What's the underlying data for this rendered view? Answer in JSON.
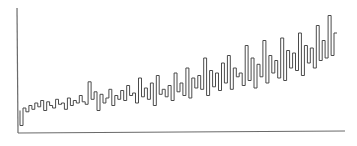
{
  "chart_data": {
    "type": "line",
    "title": "",
    "xlabel": "",
    "ylabel": "",
    "grid": false,
    "legend": null,
    "xlim": [
      0,
      107
    ],
    "ylim": [
      0,
      100
    ],
    "x": [
      0,
      1,
      2,
      3,
      4,
      5,
      6,
      7,
      8,
      9,
      10,
      11,
      12,
      13,
      14,
      15,
      16,
      17,
      18,
      19,
      20,
      21,
      22,
      23,
      24,
      25,
      26,
      27,
      28,
      29,
      30,
      31,
      32,
      33,
      34,
      35,
      36,
      37,
      38,
      39,
      40,
      41,
      42,
      43,
      44,
      45,
      46,
      47,
      48,
      49,
      50,
      51,
      52,
      53,
      54,
      55,
      56,
      57,
      58,
      59,
      60,
      61,
      62,
      63,
      64,
      65,
      66,
      67,
      68,
      69,
      70,
      71,
      72,
      73,
      74,
      75,
      76,
      77,
      78,
      79,
      80,
      81,
      82,
      83,
      84,
      85,
      86,
      87,
      88,
      89,
      90,
      91,
      92,
      93,
      94,
      95,
      96,
      97,
      98,
      99,
      100,
      101,
      102,
      103,
      104,
      105,
      106,
      107
    ],
    "series": [
      {
        "name": "series",
        "color": "#4a4a4a",
        "values": [
          18,
          6,
          20,
          17,
          22,
          19,
          24,
          21,
          26,
          18,
          25,
          22,
          20,
          27,
          23,
          24,
          19,
          28,
          22,
          26,
          24,
          30,
          25,
          23,
          41,
          27,
          33,
          18,
          31,
          24,
          28,
          35,
          22,
          30,
          27,
          34,
          26,
          38,
          30,
          32,
          24,
          44,
          29,
          36,
          27,
          40,
          22,
          46,
          31,
          35,
          29,
          38,
          26,
          48,
          33,
          40,
          30,
          52,
          28,
          44,
          36,
          46,
          35,
          60,
          30,
          50,
          37,
          48,
          34,
          56,
          40,
          62,
          35,
          52,
          45,
          48,
          38,
          70,
          42,
          60,
          36,
          55,
          45,
          74,
          40,
          62,
          48,
          58,
          44,
          76,
          42,
          66,
          52,
          64,
          50,
          80,
          46,
          70,
          56,
          68,
          52,
          86,
          58,
          74,
          60,
          94,
          62,
          80
        ]
      }
    ],
    "axes": {
      "x_axis_visible": true,
      "y_axis_visible": true,
      "tick_labels": false
    }
  }
}
